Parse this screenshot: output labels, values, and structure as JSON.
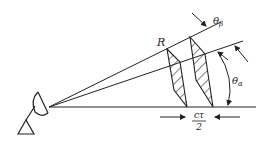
{
  "diagram": {
    "labels": {
      "range": "R",
      "beamwidth": "θ",
      "beamwidth_sub": "β",
      "elevation": "θ",
      "elevation_sub": "α",
      "pulse_num": "cτ",
      "pulse_den": "2"
    },
    "icons": [
      "radar-antenna-icon"
    ],
    "colors": {
      "stroke": "#222222",
      "background": "#ffffff"
    }
  }
}
